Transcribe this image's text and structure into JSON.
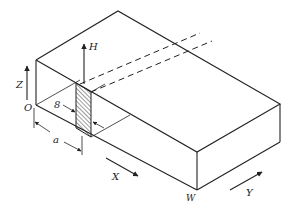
{
  "figure": {
    "colors": {
      "line": "#222222",
      "background": "#ffffff"
    },
    "labels": {
      "z_axis": "Z",
      "x_axis": "X",
      "y_axis": "Y",
      "h_field": "H",
      "origin": "O",
      "thickness": "8",
      "distance": "a",
      "width": "W"
    }
  }
}
